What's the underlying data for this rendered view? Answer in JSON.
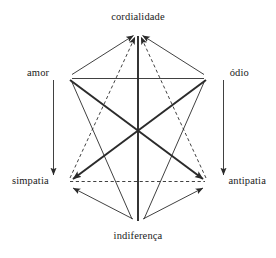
{
  "figure": {
    "type": "semiotic-hexagon-diagram",
    "background_color": "#ffffff",
    "line_color": "#2b2b2b",
    "text_color": "#1a1a1a"
  },
  "vertices": {
    "top": {
      "label": "cordialidade",
      "x": 138,
      "y": 32
    },
    "upper_left": {
      "label": "amor",
      "x": 68,
      "y": 76
    },
    "upper_right": {
      "label": "ódio",
      "x": 208,
      "y": 76
    },
    "lower_left": {
      "label": "simpatia",
      "x": 68,
      "y": 182
    },
    "lower_right": {
      "label": "antipatia",
      "x": 208,
      "y": 182
    },
    "bottom": {
      "label": "indiferença",
      "x": 138,
      "y": 226
    }
  },
  "edges": [
    {
      "name": "amor-to-cordialidade",
      "from": "amor",
      "to": "cordialidade",
      "style": "solid",
      "weight": "thin",
      "arrow": "end"
    },
    {
      "name": "odio-to-cordialidade",
      "from": "ódio",
      "to": "cordialidade",
      "style": "solid",
      "weight": "thin",
      "arrow": "end"
    },
    {
      "name": "simpatia-to-cordialidade",
      "from": "simpatia",
      "to": "cordialidade",
      "style": "dashed",
      "weight": "thin",
      "arrow": "end"
    },
    {
      "name": "antipatia-to-cordialidade",
      "from": "antipatia",
      "to": "cordialidade",
      "style": "dashed",
      "weight": "thin",
      "arrow": "end"
    },
    {
      "name": "amor-odio-horizontal",
      "from": "amor",
      "to": "ódio",
      "style": "solid",
      "weight": "thin",
      "arrow": "none"
    },
    {
      "name": "amor-to-simpatia-vertical",
      "from": "amor",
      "to": "simpatia",
      "style": "solid",
      "weight": "thin",
      "arrow": "end"
    },
    {
      "name": "odio-to-antipatia-vertical",
      "from": "ódio",
      "to": "antipatia",
      "style": "solid",
      "weight": "thin",
      "arrow": "end"
    },
    {
      "name": "amor-to-antipatia-diagonal",
      "from": "amor",
      "to": "antipatia",
      "style": "solid",
      "weight": "thick",
      "arrow": "end"
    },
    {
      "name": "odio-to-simpatia-diagonal",
      "from": "ódio",
      "to": "simpatia",
      "style": "solid",
      "weight": "thick",
      "arrow": "end"
    },
    {
      "name": "simpatia-antipatia-horizontal",
      "from": "simpatia",
      "to": "antipatia",
      "style": "dashed",
      "weight": "thin",
      "arrow": "none"
    },
    {
      "name": "indiferenca-to-simpatia",
      "from": "indiferença",
      "to": "simpatia",
      "style": "solid",
      "weight": "thin",
      "arrow": "end"
    },
    {
      "name": "indiferenca-to-antipatia",
      "from": "indiferença",
      "to": "antipatia",
      "style": "solid",
      "weight": "thin",
      "arrow": "end"
    },
    {
      "name": "indiferenca-to-amor",
      "from": "indiferença",
      "to": "amor",
      "style": "solid",
      "weight": "thin",
      "arrow": "none"
    },
    {
      "name": "indiferenca-to-odio",
      "from": "indiferença",
      "to": "ódio",
      "style": "solid",
      "weight": "thin",
      "arrow": "none"
    },
    {
      "name": "indiferenca-cordialidade-vertical",
      "from": "indiferença",
      "to": "cordialidade",
      "style": "solid",
      "weight": "thick",
      "arrow": "none"
    }
  ]
}
